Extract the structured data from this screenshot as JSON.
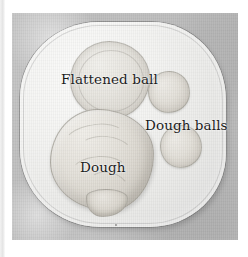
{
  "figure": {
    "caption_labels": [
      {
        "id": "flattened-ball",
        "text": "Flattened ball"
      },
      {
        "id": "dough-balls",
        "text": "Dough balls"
      },
      {
        "id": "dough",
        "text": "Dough"
      }
    ],
    "objects": {
      "plate": "white rounded-square plate",
      "flattened_ball": "flattened ball of dough",
      "dough_ball_upper": "dough ball",
      "dough_ball_lower": "dough ball",
      "dough_mass": "large lump of dough"
    },
    "colors": {
      "background": "#bdbdbd",
      "plate": "#f3f3f1",
      "dough": "#e3e0d9",
      "label_text": "#151515",
      "page": "#ffffff"
    }
  }
}
